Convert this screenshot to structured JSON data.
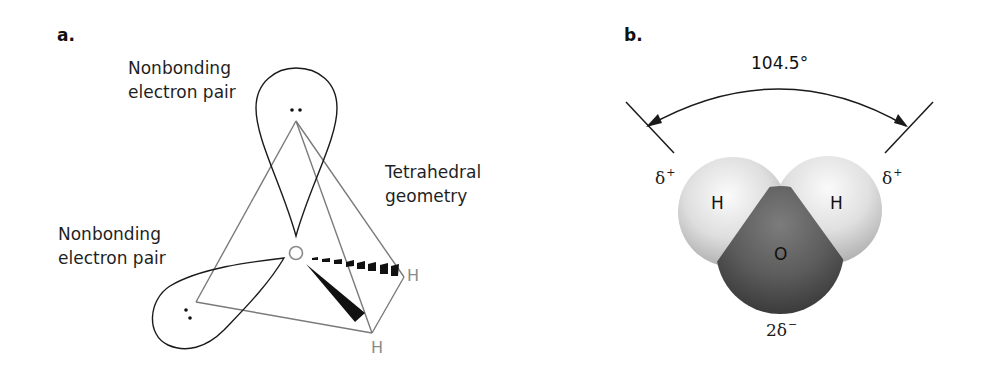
{
  "panel_a": {
    "label": "a.",
    "top_lone_pair_label_line1": "Nonbonding",
    "top_lone_pair_label_line2": "electron pair",
    "left_lone_pair_label_line1": "Nonbonding",
    "left_lone_pair_label_line2": "electron pair",
    "geometry_label_line1": "Tetrahedral",
    "geometry_label_line2": "geometry",
    "central_atom": "O",
    "hydrogen_right": "H",
    "hydrogen_bottom": "H"
  },
  "panel_b": {
    "label": "b.",
    "bond_angle": "104.5°",
    "left_charge_symbol": "δ",
    "left_charge_sign": "+",
    "right_charge_symbol": "δ",
    "right_charge_sign": "+",
    "oxygen_charge_symbol": "2δ",
    "oxygen_charge_sign": "−",
    "hydrogen_left": "H",
    "hydrogen_right": "H",
    "oxygen": "O"
  },
  "colors": {
    "outline": "#1a1a1a",
    "tetra_edge": "#7a7a7a",
    "hydrogen_sphere": "#e8e8e8",
    "oxygen_sphere": "#5a5a5a"
  }
}
